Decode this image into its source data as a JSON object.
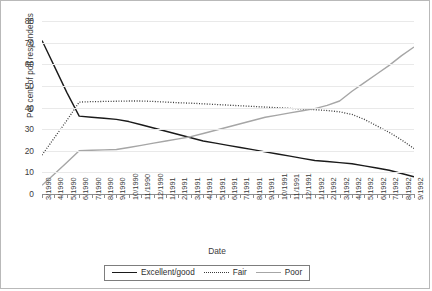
{
  "chart_data": {
    "type": "line",
    "title": "",
    "xlabel": "Date",
    "ylabel": "Per cent of poll respondents",
    "ylim": [
      0,
      80
    ],
    "ytick_step": 10,
    "yticks": [
      0,
      10,
      20,
      30,
      40,
      50,
      60,
      70,
      80
    ],
    "grid": true,
    "legend_position": "bottom",
    "categories": [
      "3/1990",
      "4/1990",
      "5/1990",
      "6/1990",
      "7/1990",
      "8/1990",
      "9/1990",
      "10/1990",
      "11/1990",
      "12/1990",
      "1/1991",
      "2/1991",
      "3/1991",
      "4/1991",
      "5/1991",
      "6/1991",
      "7/1991",
      "8/1991",
      "9/1991",
      "10/1991",
      "11/1991",
      "12/1991",
      "1/1992",
      "2/1992",
      "3/1992",
      "4/1992",
      "5/1992",
      "6/1992",
      "7/1992",
      "8/1992",
      "9/1992"
    ],
    "series": [
      {
        "name": "Excellent/good",
        "style": "solid",
        "color": "#1a1a1a",
        "values": [
          71,
          59,
          47,
          36,
          35.5,
          35,
          34.5,
          33.5,
          32,
          30.5,
          29,
          27.5,
          26,
          24.5,
          23.5,
          22.5,
          21.5,
          20.5,
          19.5,
          18.5,
          17.5,
          16.5,
          15.5,
          15,
          14.5,
          14,
          13,
          12,
          11,
          9.5,
          8
        ]
      },
      {
        "name": "Fair",
        "style": "dotted",
        "color": "#3a3a3a",
        "values": [
          18,
          26,
          34,
          42.5,
          42.7,
          42.8,
          42.9,
          43,
          43,
          42.8,
          42.5,
          42.2,
          42,
          41.7,
          41.4,
          41.1,
          40.8,
          40.5,
          40.2,
          39.9,
          39.6,
          39.3,
          39,
          38.6,
          38,
          36.8,
          34.5,
          31.5,
          28.5,
          25,
          21
        ]
      },
      {
        "name": "Poor",
        "style": "solid",
        "color": "#a6a6a6",
        "values": [
          4,
          9.3,
          14.6,
          20,
          20.2,
          20.4,
          20.6,
          21.5,
          22.5,
          23.5,
          24.5,
          25.5,
          26.5,
          28,
          29.5,
          31,
          32.5,
          34,
          35.5,
          36.5,
          37.5,
          38.5,
          39.5,
          41,
          43,
          47.5,
          51.5,
          55.5,
          59.5,
          64,
          68
        ]
      }
    ]
  },
  "legend": {
    "items": [
      {
        "label": "Excellent/good",
        "swatch": "line-solid-black-icon"
      },
      {
        "label": "Fair",
        "swatch": "line-dotted-icon"
      },
      {
        "label": "Poor",
        "swatch": "line-solid-gray-icon"
      }
    ]
  }
}
